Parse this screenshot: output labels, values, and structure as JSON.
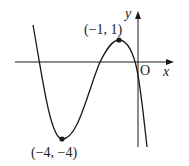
{
  "figure": {
    "type": "cubic function graph",
    "axes": {
      "x_label": "x",
      "y_label": "y",
      "origin_label": "O"
    },
    "points": [
      {
        "name": "local-maximum",
        "label": "(−1, 1)",
        "x": -1,
        "y": 1
      },
      {
        "name": "local-minimum",
        "label": "(−4, −4)",
        "x": -4,
        "y": -4
      }
    ],
    "colors": {
      "curve": "#1a1a1a",
      "axes": "#1a1a1a",
      "background": "#ffffff"
    }
  }
}
